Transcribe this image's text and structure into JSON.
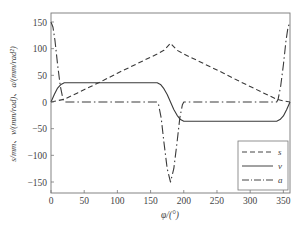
{
  "chart_data": {
    "type": "line",
    "title": "",
    "xlabel": "φ/(°)",
    "ylabel": "s/mm、v/(mm/rad)、a/(mm/rad²)",
    "xlim": [
      0,
      360
    ],
    "ylim": [
      -170,
      170
    ],
    "xticks": [
      0,
      50,
      100,
      150,
      200,
      250,
      300,
      350
    ],
    "yticks": [
      -150,
      -100,
      -50,
      0,
      50,
      100,
      150
    ],
    "xtick_labels": [
      "0",
      "50",
      "100",
      "150",
      "200",
      "250",
      "300",
      "350"
    ],
    "ytick_labels": [
      "−150",
      "−100",
      "−50",
      "0",
      "50",
      "100",
      "150"
    ],
    "grid": false,
    "legend_position": "lower right",
    "series": [
      {
        "name": "s",
        "style": "dashed",
        "x": [
          0,
          20,
          40,
          60,
          80,
          100,
          120,
          140,
          160,
          170,
          180,
          190,
          200,
          220,
          240,
          260,
          280,
          300,
          320,
          340,
          350,
          360
        ],
        "values": [
          0,
          5,
          17,
          29,
          41,
          54,
          66,
          78,
          90,
          97,
          110,
          97,
          90,
          78,
          66,
          54,
          41,
          29,
          17,
          5,
          2,
          0
        ]
      },
      {
        "name": "v",
        "style": "solid",
        "x": [
          0,
          5,
          10,
          15,
          20,
          160,
          165,
          170,
          175,
          180,
          185,
          190,
          195,
          200,
          340,
          345,
          350,
          355,
          360
        ],
        "values": [
          0,
          14,
          26,
          33,
          36,
          36,
          33,
          25,
          14,
          0,
          -14,
          -25,
          -33,
          -36,
          -36,
          -33,
          -26,
          -14,
          0
        ]
      },
      {
        "name": "a",
        "style": "dashdot",
        "x": [
          0,
          3,
          6,
          10,
          14,
          18,
          20,
          160,
          162,
          166,
          170,
          175,
          180,
          185,
          190,
          194,
          198,
          200,
          340,
          342,
          346,
          350,
          354,
          357,
          360
        ],
        "values": [
          150,
          140,
          115,
          70,
          30,
          5,
          0,
          0,
          -5,
          -30,
          -75,
          -125,
          -150,
          -125,
          -75,
          -30,
          -5,
          0,
          0,
          5,
          30,
          70,
          115,
          140,
          150
        ]
      }
    ]
  },
  "legend": {
    "items": [
      {
        "label": "s",
        "style": "dashed"
      },
      {
        "label": "v",
        "style": "solid"
      },
      {
        "label": "a",
        "style": "dashdot"
      }
    ]
  }
}
